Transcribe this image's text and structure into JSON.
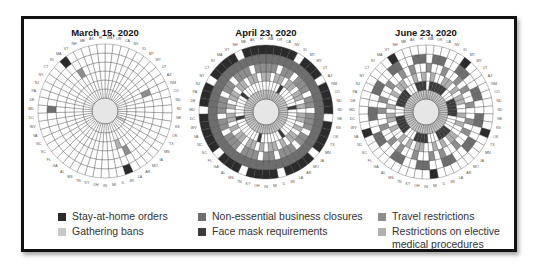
{
  "chart_data": {
    "type": "radial-heatmap",
    "states": [
      "WA",
      "OR",
      "CA",
      "NV",
      "ID",
      "MT",
      "WY",
      "UT",
      "AZ",
      "NM",
      "CO",
      "ND",
      "SD",
      "NE",
      "KS",
      "OK",
      "TX",
      "MN",
      "IA",
      "MO",
      "AR",
      "LA",
      "WI",
      "IL",
      "MI",
      "IN",
      "OH",
      "KY",
      "TN",
      "MS",
      "AL",
      "GA",
      "FL",
      "SC",
      "NC",
      "VA",
      "WV",
      "DC",
      "MD",
      "DE",
      "PA",
      "NJ",
      "NY",
      "CT",
      "RI",
      "MA",
      "VT",
      "NH",
      "ME",
      "AK",
      "HI"
    ],
    "rings_inner_to_outer": [
      "gathering_bans",
      "face_masks",
      "elective_procedures",
      "travel",
      "non_essential_closures",
      "stay_at_home"
    ],
    "panels": [
      {
        "title": "March 15, 2020",
        "rings": {
          "gathering_bans": "000000000000000010000000000000000000000000000000000",
          "face_masks": "000000000000000000000000000000000000000000000000000",
          "elective_procedures": "000000000000000000000010000000000000000000000000000",
          "travel": "000000000100000000000100000000000000000000000010000",
          "non_essential_closures": "000000000000000000000000000000000000001000000000000",
          "stay_at_home": "000000000000000000000010000000000000000000000100000"
        }
      },
      {
        "title": "April 23, 2020",
        "rings": {
          "gathering_bans": "111111111111111111111111111111111111111111111111111",
          "face_masks": "000010000001000000001000000100000000100000010000000",
          "elective_procedures": "101101101101011010110101101011011010110101101101101",
          "travel": "110110111011011101101110110111011101101110110111011",
          "non_essential_closures": "111111111111111111111111111111111111111111111111111",
          "stay_at_home": "111101110111101111011110111101110111110111011110111"
        }
      },
      {
        "title": "June 23, 2020",
        "rings": {
          "gathering_bans": "111111111111111111111111111111111111111111111111111",
          "face_masks": "011111000111110000111100011110001111100011111000111",
          "elective_procedures": "010011010110010100110101001101010010110100101100101",
          "travel": "100100101001001010010010100100101001001010010010100",
          "non_essential_closures": "011001100110011001100110011001100110011001100110011",
          "stay_at_home": "000001000000000100000000100000000001000000000010000"
        }
      }
    ],
    "legend": [
      {
        "key": "stay_at_home",
        "label": "Stay-at-home orders",
        "color": "#2b2b2b"
      },
      {
        "key": "non_essential_closures",
        "label": "Non-essential business closures",
        "color": "#6e6e6e"
      },
      {
        "key": "travel",
        "label": "Travel restrictions",
        "color": "#8e8e8e"
      },
      {
        "key": "gathering_bans",
        "label": "Gathering bans",
        "color": "#c8c8c8"
      },
      {
        "key": "face_masks",
        "label": "Face mask requirements",
        "color": "#3c3c3c"
      },
      {
        "key": "elective_procedures",
        "label": "Restrictions on elective medical procedures",
        "color": "#b0b0b0"
      }
    ]
  },
  "panels": [
    {
      "title": "March 15, 2020"
    },
    {
      "title": "April 23, 2020"
    },
    {
      "title": "June 23, 2020"
    }
  ],
  "legend": {
    "stay_at_home": "Stay-at-home orders",
    "gathering_bans": "Gathering bans",
    "non_essential_closures": "Non-essential business closures",
    "face_masks": "Face mask requirements",
    "travel": "Travel restrictions",
    "elective_procedures": "Restrictions on elective medical procedures",
    "colors": {
      "stay_at_home": "#2b2b2b",
      "gathering_bans": "#c8c8c8",
      "non_essential_closures": "#6e6e6e",
      "face_masks": "#3c3c3c",
      "travel": "#8e8e8e",
      "elective_procedures": "#b0b0b0"
    }
  }
}
